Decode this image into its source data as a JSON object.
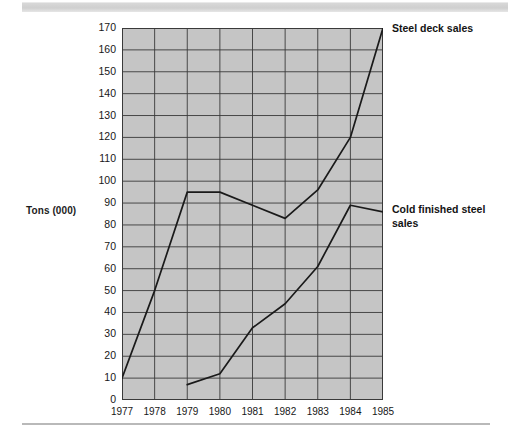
{
  "chart_data": {
    "type": "line",
    "title": "",
    "xlabel": "",
    "ylabel": "Tons (000)",
    "x": [
      1977,
      1978,
      1979,
      1980,
      1981,
      1982,
      1983,
      1984,
      1985
    ],
    "categories": [
      "1977",
      "1978",
      "1979",
      "1980",
      "1981",
      "1982",
      "1983",
      "1984",
      "1985"
    ],
    "ylim": [
      0,
      170
    ],
    "xlim": [
      1977,
      1985
    ],
    "y_ticks": [
      0,
      10,
      20,
      30,
      40,
      50,
      60,
      70,
      80,
      90,
      100,
      110,
      120,
      130,
      140,
      150,
      160,
      170
    ],
    "y_tick_labels": [
      "0",
      "10",
      "20",
      "30",
      "40",
      "50",
      "60",
      "70",
      "80",
      "90",
      "100",
      "110",
      "120",
      "130",
      "140",
      "150",
      "160",
      "170"
    ],
    "grid": true,
    "legend_position": "line-end-right",
    "plot_background_color": "#c5c5c5",
    "grid_color": "#3a3a3a",
    "line_color": "#1a1a1a",
    "series": [
      {
        "name": "Steel deck sales",
        "label_text": "Steel deck sales",
        "x": [
          1977,
          1978,
          1979,
          1980,
          1981,
          1982,
          1983,
          1984,
          1985
        ],
        "values": [
          10,
          50,
          95,
          95,
          89,
          83,
          96,
          120,
          170
        ]
      },
      {
        "name": "Cold finished steel sales",
        "label_text": "Cold finished steel\nsales",
        "x": [
          1979,
          1980,
          1981,
          1982,
          1983,
          1984,
          1985
        ],
        "values": [
          7,
          12,
          33,
          44,
          61,
          89,
          86
        ]
      }
    ]
  }
}
